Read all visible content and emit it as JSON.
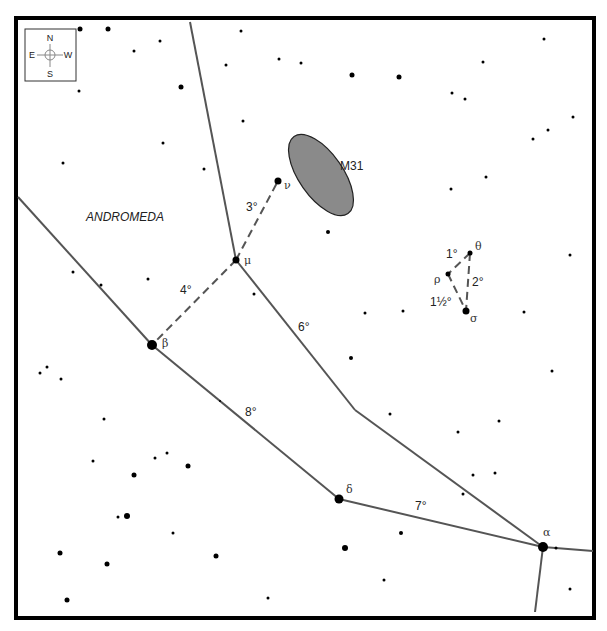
{
  "map": {
    "constellation_label": "ANDROMEDA",
    "colors": {
      "border": "#000000",
      "line": "#555555",
      "dashed": "#555555",
      "star": "#000000",
      "galaxy_fill": "#8a8a8a",
      "galaxy_stroke": "#222222"
    },
    "compass": {
      "n": "N",
      "s": "S",
      "e": "E",
      "w": "W"
    },
    "galaxy": {
      "label": "M31",
      "cx": 321,
      "cy": 175,
      "rx": 22,
      "ry": 47,
      "angle": -35,
      "label_x": 340,
      "label_y": 170
    },
    "named_stars": [
      {
        "id": "alpha",
        "label": "α",
        "x": 543,
        "y": 547,
        "r": 5,
        "lx": 543,
        "ly": 536
      },
      {
        "id": "beta",
        "label": "β",
        "x": 152,
        "y": 345,
        "r": 5,
        "lx": 162,
        "ly": 347
      },
      {
        "id": "delta",
        "label": "δ",
        "x": 339,
        "y": 499,
        "r": 4.5,
        "lx": 346,
        "ly": 493
      },
      {
        "id": "mu",
        "label": "μ",
        "x": 236,
        "y": 260,
        "r": 3.5,
        "lx": 244,
        "ly": 264
      },
      {
        "id": "nu",
        "label": "ν",
        "x": 278,
        "y": 181,
        "r": 3.5,
        "lx": 284,
        "ly": 189
      },
      {
        "id": "theta",
        "label": "θ",
        "x": 470,
        "y": 253,
        "r": 2.5,
        "lx": 475,
        "ly": 250
      },
      {
        "id": "rho",
        "label": "ρ",
        "x": 448,
        "y": 274,
        "r": 2.5,
        "lx": 434,
        "ly": 283
      },
      {
        "id": "sigma",
        "label": "σ",
        "x": 466,
        "y": 311,
        "r": 3.5,
        "lx": 470,
        "ly": 322
      }
    ],
    "solid_lines": [
      [
        190,
        22,
        236,
        260
      ],
      [
        236,
        260,
        355,
        410
      ],
      [
        355,
        410,
        543,
        547
      ],
      [
        18,
        197,
        152,
        345
      ],
      [
        152,
        345,
        339,
        499
      ],
      [
        339,
        499,
        543,
        547
      ],
      [
        543,
        547,
        593,
        551
      ],
      [
        543,
        547,
        535,
        612
      ]
    ],
    "dashed_lines": [
      [
        236,
        260,
        278,
        181
      ],
      [
        236,
        260,
        152,
        345
      ],
      [
        470,
        253,
        448,
        274
      ],
      [
        470,
        253,
        466,
        311
      ],
      [
        448,
        274,
        466,
        311
      ]
    ],
    "distance_labels": [
      {
        "text": "3°",
        "x": 246,
        "y": 211
      },
      {
        "text": "4°",
        "x": 180,
        "y": 294
      },
      {
        "text": "6°",
        "x": 298,
        "y": 331
      },
      {
        "text": "8°",
        "x": 245,
        "y": 416
      },
      {
        "text": "7°",
        "x": 415,
        "y": 510
      },
      {
        "text": "1°",
        "x": 446,
        "y": 258
      },
      {
        "text": "2°",
        "x": 472,
        "y": 286
      },
      {
        "text": "1½°",
        "x": 430,
        "y": 306
      }
    ],
    "stars": [
      [
        80,
        29,
        2.5
      ],
      [
        108,
        29,
        2.5
      ],
      [
        134,
        51,
        1.5
      ],
      [
        160,
        41,
        1.5
      ],
      [
        241,
        31,
        1.5
      ],
      [
        226,
        65,
        1.5
      ],
      [
        279,
        59,
        1.5
      ],
      [
        181,
        87,
        2.5
      ],
      [
        301,
        63,
        1.5
      ],
      [
        352,
        75,
        2.5
      ],
      [
        399,
        77,
        2.5
      ],
      [
        452,
        93,
        1.5
      ],
      [
        465,
        99,
        1.5
      ],
      [
        483,
        62,
        1.5
      ],
      [
        544,
        39,
        1.5
      ],
      [
        573,
        117,
        1.5
      ],
      [
        548,
        130,
        1.5
      ],
      [
        533,
        139,
        1.5
      ],
      [
        79,
        91,
        1.5
      ],
      [
        163,
        143,
        1.5
      ],
      [
        63,
        163,
        1.5
      ],
      [
        243,
        121,
        1.5
      ],
      [
        204,
        169,
        1.5
      ],
      [
        486,
        177,
        1.5
      ],
      [
        451,
        189,
        1.5
      ],
      [
        328,
        232,
        2
      ],
      [
        570,
        255,
        1.5
      ],
      [
        403,
        311,
        1.5
      ],
      [
        524,
        312,
        1.5
      ],
      [
        73,
        272,
        1.5
      ],
      [
        101,
        285,
        1.5
      ],
      [
        148,
        279,
        1.5
      ],
      [
        254,
        294,
        1.5
      ],
      [
        365,
        313,
        1.5
      ],
      [
        351,
        358,
        2
      ],
      [
        390,
        414,
        1.5
      ],
      [
        220,
        401,
        1
      ],
      [
        40,
        373,
        1.5
      ],
      [
        47,
        367,
        1.5
      ],
      [
        61,
        379,
        1.5
      ],
      [
        104,
        419,
        1.5
      ],
      [
        552,
        371,
        1.5
      ],
      [
        458,
        432,
        1.5
      ],
      [
        499,
        421,
        1.5
      ],
      [
        473,
        475,
        1.5
      ],
      [
        495,
        473,
        1.5
      ],
      [
        463,
        494,
        1.5
      ],
      [
        93,
        461,
        1.5
      ],
      [
        134,
        475,
        2.5
      ],
      [
        155,
        458,
        1.5
      ],
      [
        167,
        453,
        1.5
      ],
      [
        188,
        466,
        2.5
      ],
      [
        118,
        517,
        1.5
      ],
      [
        127,
        516,
        3
      ],
      [
        173,
        533,
        1.5
      ],
      [
        60,
        553,
        2.5
      ],
      [
        107,
        564,
        2.5
      ],
      [
        216,
        556,
        2.5
      ],
      [
        67,
        600,
        2.5
      ],
      [
        268,
        598,
        1.5
      ],
      [
        401,
        533,
        2
      ],
      [
        345,
        548,
        3
      ],
      [
        384,
        580,
        1.5
      ],
      [
        556,
        548,
        1.5
      ],
      [
        570,
        589,
        1.5
      ]
    ]
  }
}
